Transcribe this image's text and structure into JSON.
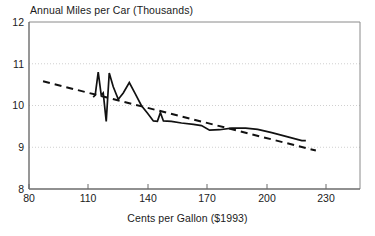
{
  "chart_data": {
    "type": "line",
    "title": "Annual Miles per Car (Thousands)",
    "xlabel": "Cents per Gallon ($1993)",
    "ylabel": "Annual Miles per Car (Thousands)",
    "xlim": [
      80,
      245
    ],
    "ylim": [
      8,
      12
    ],
    "xticks": [
      80,
      110,
      140,
      170,
      200,
      230
    ],
    "yticks": [
      8,
      9,
      10,
      11,
      12
    ],
    "xtick_labels": [
      "80",
      "110",
      "140",
      "170",
      "200",
      "230"
    ],
    "ytick_labels": [
      "8",
      "9",
      "10",
      "11",
      "12"
    ],
    "grid": "horizontal-dotted",
    "legend": "none",
    "series": [
      {
        "name": "Annual miles per car",
        "style": "solid",
        "color": "#000000",
        "points": [
          [
            112.0,
            10.2
          ],
          [
            113.0,
            10.25
          ],
          [
            114.5,
            10.8
          ],
          [
            116.0,
            10.25
          ],
          [
            117.0,
            10.3
          ],
          [
            118.5,
            9.62
          ],
          [
            120.0,
            10.78
          ],
          [
            122.0,
            10.45
          ],
          [
            124.5,
            10.15
          ],
          [
            127.0,
            10.3
          ],
          [
            130.0,
            10.55
          ],
          [
            133.0,
            10.28
          ],
          [
            136.0,
            10.0
          ],
          [
            139.0,
            9.82
          ],
          [
            142.0,
            9.63
          ],
          [
            144.0,
            9.62
          ],
          [
            145.5,
            9.83
          ],
          [
            147.0,
            9.63
          ],
          [
            151.0,
            9.62
          ],
          [
            156.0,
            9.58
          ],
          [
            162.0,
            9.55
          ],
          [
            166.0,
            9.52
          ],
          [
            170.0,
            9.41
          ],
          [
            175.0,
            9.42
          ],
          [
            181.0,
            9.46
          ],
          [
            188.0,
            9.46
          ],
          [
            194.0,
            9.43
          ],
          [
            201.0,
            9.35
          ],
          [
            209.0,
            9.25
          ],
          [
            216.0,
            9.16
          ],
          [
            218.0,
            9.16
          ]
        ]
      },
      {
        "name": "Trend line",
        "style": "dashed",
        "color": "#000000",
        "points": [
          [
            87.0,
            10.58
          ],
          [
            223.0,
            8.92
          ]
        ]
      }
    ]
  },
  "axes": {
    "title": "Annual Miles per Car (Thousands)",
    "x_title": "Cents per Gallon ($1993)",
    "y_ticks": [
      "12",
      "11",
      "10",
      "9",
      "8"
    ],
    "x_ticks": [
      "80",
      "110",
      "140",
      "170",
      "200",
      "230"
    ]
  }
}
